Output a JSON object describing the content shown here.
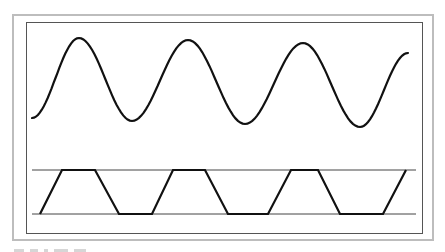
{
  "figure": {
    "colors": {
      "outer_frame": "#bdbdbd",
      "inner_frame": "#555555",
      "stroke": "#111111",
      "rails": "#444444"
    }
  },
  "sine_wave": {
    "points": [
      [
        32,
        118
      ],
      [
        79,
        38
      ],
      [
        132,
        121
      ],
      [
        188,
        40
      ],
      [
        245,
        124
      ],
      [
        303,
        43
      ],
      [
        360,
        127
      ],
      [
        408,
        53
      ]
    ]
  },
  "trapezoid_wave": {
    "top_rail_y": 170,
    "bottom_rail_y": 214,
    "rail_x": [
      32,
      416
    ],
    "points": [
      [
        40,
        214
      ],
      [
        62,
        170
      ],
      [
        95,
        170
      ],
      [
        119,
        214
      ],
      [
        152,
        214
      ],
      [
        173,
        170
      ],
      [
        205,
        170
      ],
      [
        228,
        214
      ],
      [
        268,
        214
      ],
      [
        291,
        170
      ],
      [
        318,
        170
      ],
      [
        340,
        214
      ],
      [
        383,
        214
      ],
      [
        406,
        170
      ]
    ]
  }
}
